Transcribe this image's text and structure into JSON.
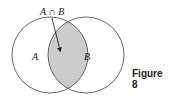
{
  "diagram": {
    "type": "venn",
    "sets": [
      {
        "name": "A",
        "label": "A"
      },
      {
        "name": "B",
        "label": "B"
      }
    ],
    "intersection_label": "A ∩ B",
    "shade_color": "#cccccc",
    "stroke_color": "#555555"
  },
  "caption": "Figure 8"
}
